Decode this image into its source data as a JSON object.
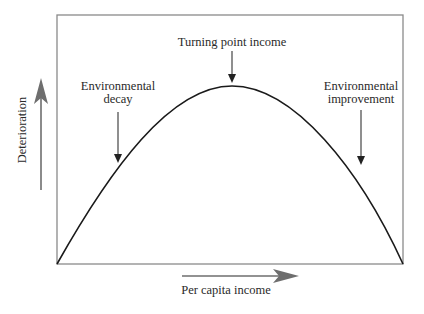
{
  "diagram": {
    "type": "Environmental Kuznets Curve (inverted U)",
    "x_axis_label": "Per capita income",
    "y_axis_label": "Deterioration",
    "annotations": [
      {
        "id": "turning-point",
        "text": "Turning point income"
      },
      {
        "id": "decay",
        "line1": "Environmental",
        "line2": "decay"
      },
      {
        "id": "improvement",
        "line1": "Environmental",
        "line2": "improvement"
      }
    ],
    "colors": {
      "frame": "#8a8a8a",
      "curve": "#1a1a1a",
      "axis_arrows": "#6e6e6e",
      "pointer_arrows": "#333333",
      "text": "#2a2a2a"
    }
  }
}
